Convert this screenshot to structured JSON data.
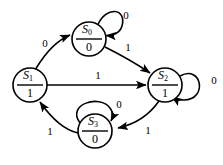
{
  "diagram": {
    "type": "finite-state-machine",
    "canvas": {
      "width": 223,
      "height": 165
    },
    "colors": {
      "background": "#ffffff",
      "stroke": "#000000",
      "text": "#000000"
    },
    "states": [
      {
        "id": "s0",
        "name": "S",
        "subscript": "0",
        "output": "0",
        "cx": 89,
        "cy": 39,
        "r": 17
      },
      {
        "id": "s1",
        "name": "S",
        "subscript": "1",
        "output": "1",
        "cx": 30,
        "cy": 85,
        "r": 17
      },
      {
        "id": "s2",
        "name": "S",
        "subscript": "2",
        "output": "1",
        "cx": 165,
        "cy": 85,
        "r": 17
      },
      {
        "id": "s3",
        "name": "S",
        "subscript": "3",
        "output": "0",
        "cx": 95,
        "cy": 131,
        "r": 17
      }
    ],
    "transitions": [
      {
        "id": "t-s1-s0",
        "from": "s1",
        "to": "s0",
        "input": "0",
        "kind": "curve",
        "label_x": 45,
        "label_y": 44
      },
      {
        "id": "t-s0-s0",
        "from": "s0",
        "to": "s0",
        "input": "0",
        "kind": "self-loop",
        "label_x": 126,
        "label_y": 16
      },
      {
        "id": "t-s0-s2",
        "from": "s0",
        "to": "s2",
        "input": "1",
        "kind": "curve",
        "label_x": 128,
        "label_y": 48
      },
      {
        "id": "t-s1-s2",
        "from": "s1",
        "to": "s2",
        "input": "1",
        "kind": "straight",
        "label_x": 98,
        "label_y": 76
      },
      {
        "id": "t-s2-s2",
        "from": "s2",
        "to": "s2",
        "input": "0",
        "kind": "self-loop",
        "label_x": 214,
        "label_y": 81
      },
      {
        "id": "t-s2-s3",
        "from": "s2",
        "to": "s3",
        "input": "1",
        "kind": "curve",
        "label_x": 148,
        "label_y": 131
      },
      {
        "id": "t-s3-s3",
        "from": "s3",
        "to": "s3",
        "input": "0",
        "kind": "self-loop",
        "label_x": 119,
        "label_y": 105
      },
      {
        "id": "t-s3-s1",
        "from": "s3",
        "to": "s1",
        "input": "1",
        "kind": "curve",
        "label_x": 50,
        "label_y": 132
      }
    ]
  }
}
